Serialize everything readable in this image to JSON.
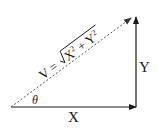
{
  "diagram": {
    "type": "vector-decomposition",
    "labels": {
      "x": "X",
      "y": "Y",
      "angle": "θ",
      "formula_lhs": "V = ",
      "formula_radicand_x": "X",
      "formula_plus": " + ",
      "formula_radicand_y": "Y",
      "formula_exp": "2"
    },
    "colors": {
      "line": "#1a1a1a",
      "dashed": "#555555",
      "background": "#ffffff"
    }
  }
}
